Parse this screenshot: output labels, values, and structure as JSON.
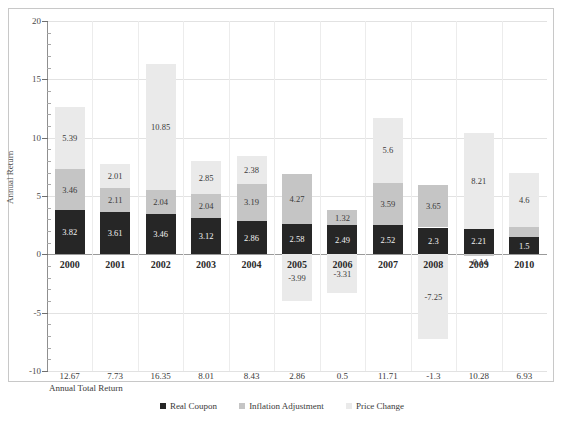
{
  "chart_data": {
    "type": "bar",
    "title": "",
    "subtitle": "",
    "xlabel": "",
    "ylabel": "Annual Return",
    "ylim": [
      -10,
      20
    ],
    "yticks": [
      20,
      15,
      10,
      5,
      0,
      -5,
      -10
    ],
    "ytick_labels": [
      "20",
      "15",
      "10",
      "5",
      "0",
      "-5",
      "-10"
    ],
    "grid": true,
    "stacked": true,
    "legend_position": "bottom",
    "categories": [
      "2000",
      "2001",
      "2002",
      "2003",
      "2004",
      "2005",
      "2006",
      "2007",
      "2008",
      "2009",
      "2010"
    ],
    "series": [
      {
        "name": "Real Coupon",
        "color": "#262626",
        "values": [
          3.82,
          3.61,
          3.46,
          3.12,
          2.86,
          2.58,
          2.49,
          2.52,
          2.3,
          2.21,
          1.5
        ]
      },
      {
        "name": "Inflation Adjustment",
        "color": "#c5c5c5",
        "values": [
          3.46,
          2.11,
          2.04,
          2.04,
          3.19,
          4.27,
          1.32,
          3.59,
          3.65,
          -0.14,
          0.83
        ]
      },
      {
        "name": "Price Change",
        "color": "#eaeaea",
        "values": [
          5.39,
          2.01,
          10.85,
          2.85,
          2.38,
          -3.99,
          -3.31,
          5.6,
          -7.25,
          8.21,
          4.6
        ]
      }
    ],
    "totals_label": "Annual Total Return",
    "totals": [
      12.67,
      7.73,
      16.35,
      8.01,
      8.43,
      2.86,
      0.5,
      11.71,
      -1.3,
      10.28,
      6.93
    ]
  },
  "legend": {
    "items": [
      {
        "label": "Real Coupon",
        "color": "#262626"
      },
      {
        "label": "Inflation Adjustment",
        "color": "#c5c5c5"
      },
      {
        "label": "Price Change",
        "color": "#eaeaea"
      }
    ]
  }
}
